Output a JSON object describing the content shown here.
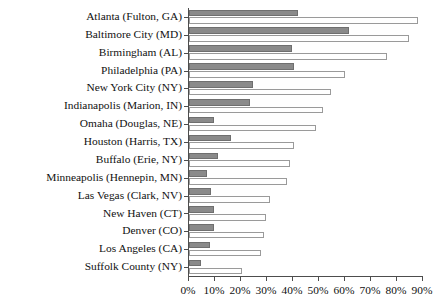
{
  "chart_data": {
    "type": "bar",
    "orientation": "horizontal",
    "title": "",
    "subtitle": "",
    "xlabel": "",
    "ylabel": "",
    "xlim": [
      0,
      90
    ],
    "xtick_labels": [
      "0%",
      "10%",
      "20%",
      "30%",
      "40%",
      "50%",
      "60%",
      "70%",
      "80%",
      "90%"
    ],
    "xticks": [
      0,
      10,
      20,
      30,
      40,
      50,
      60,
      70,
      80,
      90
    ],
    "grid": false,
    "legend": "none",
    "categories": [
      "Atlanta (Fulton, GA)",
      "Baltimore City (MD)",
      "Birmingham (AL)",
      "Philadelphia (PA)",
      "New York City (NY)",
      "Indianapolis (Marion, IN)",
      "Omaha (Douglas, NE)",
      "Houston (Harris, TX)",
      "Buffalo (Erie, NY)",
      "Minneapolis (Hennepin, MN)",
      "Las Vegas (Clark, NV)",
      "New Haven (CT)",
      "Denver (CO)",
      "Los Angeles (CA)",
      "Suffolk County (NY)"
    ],
    "series": [
      {
        "name": "dark-series",
        "color": "#8a8a8a",
        "values": [
          42.0,
          61.5,
          39.5,
          40.5,
          24.5,
          23.5,
          9.5,
          16.0,
          11.0,
          7.0,
          8.5,
          9.5,
          9.5,
          8.0,
          4.5
        ]
      },
      {
        "name": "light-series",
        "color": "#ffffff",
        "values": [
          88.0,
          84.5,
          76.0,
          60.0,
          54.5,
          51.5,
          49.0,
          40.5,
          39.0,
          37.5,
          31.0,
          29.5,
          29.0,
          27.5,
          20.5
        ]
      }
    ]
  }
}
